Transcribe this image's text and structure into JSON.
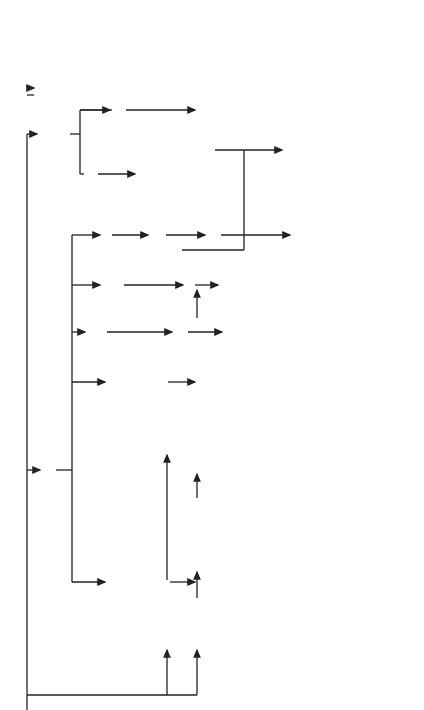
{
  "source": {
    "formula": "K ¹⁴CN",
    "name": "Potassium cyanide"
  },
  "branches": {
    "thiocyanate": {
      "source": {
        "formula": "K¹⁴CNS",
        "name": "Potassium thiocyanate"
      },
      "thiourea": "¹⁴CS(NH₂)₂",
      "thiouracil": {
        "substituent": "CH(OC₂H₅)",
        "atoms": [
          "H",
          "N",
          "S",
          "14",
          "NH",
          "O"
        ]
      },
      "orotic": {
        "substituent": "COOH",
        "name": "Orotic acid-2-C14"
      },
      "mercaptoimidazole": {
        "side_chain": "CH₂CH(NH₂)COOH",
        "atoms": [
          "NH",
          "N",
          "14",
          "SH"
        ]
      },
      "histidine": {
        "side_chain": "CH₂CH(NH₂)COOH",
        "name": "L-Histidine(2-ring-C14)"
      }
    },
    "hydroxynitriles": {
      "formula": "RCH (OH)¹⁴CN",
      "name": "α-Hydroxynitriles",
      "lysine_precursor": "CH₂OH(CH₂)₃CH(OH)¹⁴CN",
      "lysine": {
        "formula": "NH₂(CH₂)₄CH(NH₂)¹⁴COOH",
        "name": "DL-Lysine-1-C14",
        "note": "and others",
        "class": "α-Amino acids-1-C14"
      },
      "glycero_nitrile": "CH₂OHCH(OH)¹⁴CN",
      "glyceric": {
        "formula": "CH₂OHCHOH¹⁴COOH",
        "name": "DL-Glyceric acid-1-C14",
        "note": "and others",
        "class": "α-Hydroxy acids-1-C14"
      },
      "glycerol": {
        "formula": "CH₂OHCHOH¹⁴CH₂OH",
        "name": "DL-Glycerol-1-C14"
      },
      "sugars": [
        "D-Glucose-1-C14",
        "D-Galactose-1-C14",
        "D-Ribose-1-C14",
        "D-Arabinose-1-C14",
        "D-Glucose-6-C14",
        "D-Glucose-2-C14"
      ]
    },
    "nitriles": {
      "label": "Nitriles",
      "chain1": {
        "step1": "¹⁴CN(CH₂)₃Cl",
        "step2": "¹⁴CN(CH₂)₃CH(COOC₂H₅)₂",
        "step3": "¹⁴CN(CH₂)₃C(NOH)(COOC₂H₅)₂",
        "product": {
          "formula": "NH₂¹⁴CH₂(CH₂)₃CH(NH₂)COOH",
          "name": "DL-Lysine-6-C14"
        }
      },
      "chain2": {
        "step1": "Cu₂(¹⁴CN)₂",
        "step2": "CH₃CO¹⁴CN",
        "product": {
          "formula": "CH₃CO¹⁴COOH",
          "name": "Pyruvic acid-1-C14"
        }
      },
      "chain3": {
        "step1": "¹⁴CNCH₂CONH₂",
        "step2": "¹⁴CNCH₂CN",
        "product": {
          "name_line1": "Adenine-4,",
          "name_line2": "6-C14",
          "atoms": [
            "NH₂",
            "N",
            "14",
            "NH",
            "N"
          ]
        }
      },
      "chain4": {
        "step1": {
          "top": "CH₂¹⁴CN",
          "mid": "HO—C—COOH",
          "bot": "CH₂COOH",
          "name": "D-and L-isomers"
        },
        "product": {
          "top": "CH₂¹⁴COOH",
          "mid": "HO—C—COOH",
          "bot": "CH₂COOH",
          "name_line1": "D-and L-Citric acid",
          "name_line2": "-1-C14"
        }
      },
      "chain5": {
        "step1": {
          "label": "¹⁴CN",
          "groups": [
            "OH",
            "H",
            "H",
            "H",
            "HO"
          ]
        },
        "product": {
          "label": "¹⁴COOH",
          "groups": [
            "OH",
            "H",
            "H",
            "H",
            "HO"
          ],
          "name": "Deoxycholic acid-24-C14"
        }
      }
    },
    "bottom": {
      "methylamine": "¹⁴CH₃NH₂",
      "diazomethane": {
        "formula": "¹⁴CH₂N₂",
        "name": "Diazomethane"
      },
      "hydroxypropionitrile": "¹⁴CNCH₂CH₂OH",
      "acrylonitrile": "¹⁴CNCH ══ CH₂",
      "malonate": "¹⁴CN(CH₂)₂C(NHCHO)(COOC₂H₅)₂",
      "glutamic": {
        "formula": "HOO¹⁴C(CH₂)₂CH(NH₂)COOH",
        "name": "DL-Glutamic acid-5-C14"
      }
    }
  }
}
